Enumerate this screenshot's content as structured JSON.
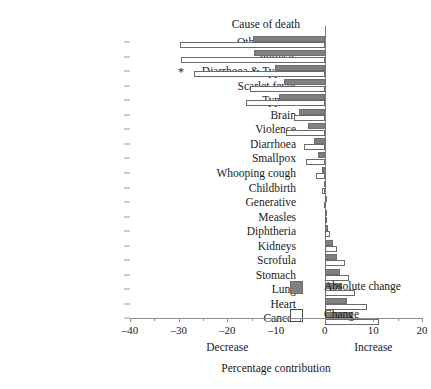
{
  "chart_data": {
    "type": "bar",
    "orientation": "horizontal",
    "title": "",
    "category_axis_title": "Cause of death",
    "xlabel": "Percentage contribution",
    "xlabel_left": "Decrease",
    "xlabel_right": "Increase",
    "ylabel": "",
    "xlim": [
      -40,
      20
    ],
    "xticks": [
      -40,
      -30,
      -20,
      -10,
      0,
      10,
      20
    ],
    "xticklabels": [
      "–40",
      "–30",
      "–20",
      "–10",
      "0",
      "10",
      "20"
    ],
    "xminorticks": [
      -35,
      -25,
      -15,
      -5,
      5,
      15
    ],
    "grid": false,
    "legend_position": "center-left-inside",
    "categories": [
      "Other causes",
      "Phthisis",
      "Diarrhoea & Typhus",
      "Scarlet fever",
      "Typhus",
      "Brain",
      "Violence",
      "Diarrhoea",
      "Smallpox",
      "Whooping cough",
      "Childbirth",
      "Generative",
      "Measles",
      "Diphtheria",
      "Kidneys",
      "Scrofula",
      "Stomach",
      "Lung",
      "Heart",
      "Cancer"
    ],
    "series": [
      {
        "name": "Absolute change",
        "color": "#808080",
        "values": [
          -14.7,
          -14.5,
          -10.2,
          -8.3,
          -9.4,
          -5.2,
          -3.4,
          -2.1,
          -1.4,
          -0.6,
          -0.2,
          0.0,
          0.3,
          0.7,
          1.7,
          2.6,
          3.2,
          3.6,
          4.6,
          5.7
        ]
      },
      {
        "name": "Change",
        "color": "#ffffff",
        "values": [
          -29.7,
          -29.6,
          -26.8,
          -15.3,
          -16.2,
          -6.2,
          -8.0,
          -4.3,
          -3.8,
          -1.8,
          -0.6,
          -0.1,
          0.5,
          1.2,
          2.6,
          4.2,
          5.0,
          6.2,
          8.6,
          11.1
        ]
      }
    ],
    "annotations": [
      {
        "text": "*",
        "category": "Diarrhoea & Typhus",
        "x": -29.5
      }
    ]
  },
  "legend": {
    "items": [
      {
        "label": "Absolute change",
        "swatch": "dark"
      },
      {
        "label": "Change",
        "swatch": "light"
      }
    ]
  }
}
